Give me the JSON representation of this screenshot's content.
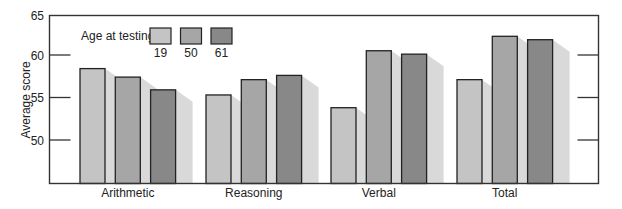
{
  "chart_data": {
    "type": "bar",
    "title": "",
    "xlabel": "",
    "ylabel": "Average score",
    "ylim": [
      45,
      65
    ],
    "yticks": [
      50,
      55,
      60,
      65
    ],
    "grid": false,
    "legend_title": "Age at testing:",
    "legend_position": "top-left inside",
    "categories": [
      "Arithmetic",
      "Reasoning",
      "Verbal",
      "Total"
    ],
    "series": [
      {
        "name": "19",
        "color": "#c4c4c4",
        "values": [
          58.4,
          55.3,
          53.8,
          57.1
        ]
      },
      {
        "name": "50",
        "color": "#a6a6a6",
        "values": [
          57.4,
          57.1,
          60.5,
          62.2
        ]
      },
      {
        "name": "61",
        "color": "#888888",
        "values": [
          55.9,
          57.6,
          60.1,
          61.8
        ]
      }
    ],
    "shadow_color": "#d9d9d9"
  }
}
